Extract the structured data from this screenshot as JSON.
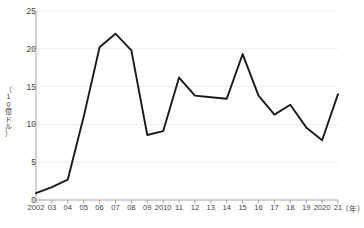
{
  "chart_data": {
    "type": "line",
    "title": "",
    "xlabel": "（年）",
    "ylabel": "（10億ドル）",
    "ylabel_chars": [
      "（",
      "1",
      "0",
      "億",
      "ド",
      "ル",
      "）"
    ],
    "categories": [
      "2002",
      "03",
      "04",
      "05",
      "06",
      "07",
      "08",
      "09",
      "2010",
      "11",
      "12",
      "13",
      "14",
      "15",
      "16",
      "17",
      "18",
      "19",
      "2020",
      "21"
    ],
    "x": [
      2002,
      2003,
      2004,
      2005,
      2006,
      2007,
      2008,
      2009,
      2010,
      2011,
      2012,
      2013,
      2014,
      2015,
      2016,
      2017,
      2018,
      2019,
      2020,
      2021
    ],
    "values": [
      0.9,
      1.7,
      2.7,
      11.0,
      20.2,
      22.0,
      19.8,
      8.6,
      9.1,
      16.2,
      13.8,
      13.6,
      13.4,
      19.3,
      13.8,
      11.3,
      12.6,
      9.6,
      7.9,
      14.0
    ],
    "ylim": [
      0,
      25
    ],
    "yticks": [
      0,
      5,
      10,
      15,
      20,
      25
    ],
    "ytick_labels": [
      "0",
      "5",
      "10",
      "15",
      "20",
      "25"
    ],
    "grid": true,
    "grid_axis": "y",
    "legend": "none",
    "line_color": "#1a1a1a",
    "grid_color": "#e8e8e8",
    "axis_color": "#9a9a9a",
    "text_color": "#444444"
  }
}
